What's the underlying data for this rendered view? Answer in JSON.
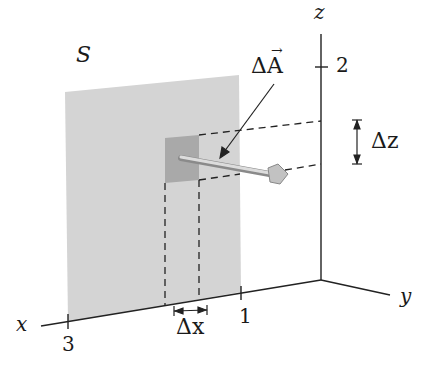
{
  "diagram": {
    "surface_label": "S",
    "vector_label": "ΔA⃗",
    "vector_label_text": "ΔA",
    "dz_label": "Δz",
    "dx_label": "Δx",
    "axes": {
      "x": {
        "label": "x",
        "ticks": [
          {
            "value": "3"
          },
          {
            "value": "1"
          }
        ]
      },
      "y": {
        "label": "y"
      },
      "z": {
        "label": "z",
        "ticks": [
          {
            "value": "2"
          }
        ]
      }
    },
    "colors": {
      "surface": "#d4d4d4",
      "patch": "#a9a9a9",
      "lines": "#222222",
      "vector": "#c8c8c8"
    }
  }
}
